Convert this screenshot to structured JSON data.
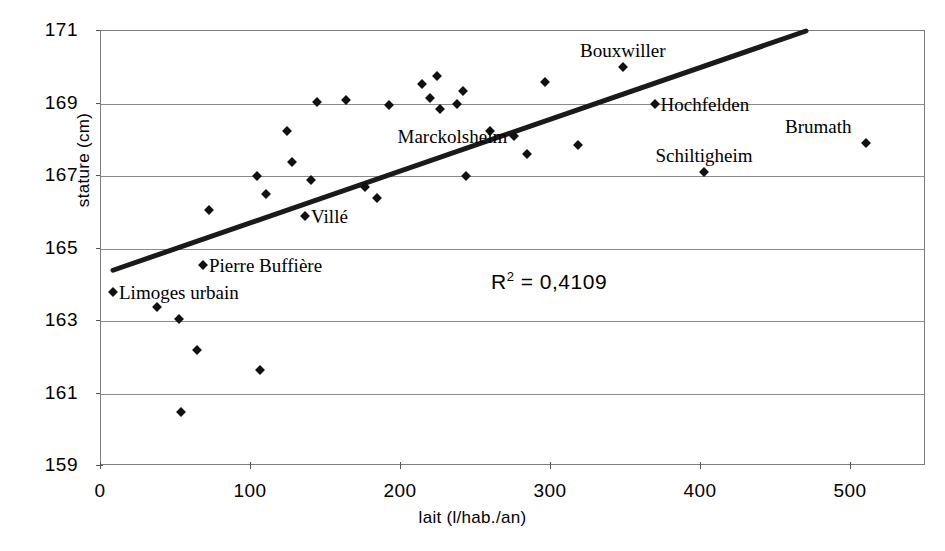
{
  "chart_data": {
    "type": "scatter",
    "title": "",
    "xlabel": "lait  (l/hab./an)",
    "ylabel": "stature  (cm)",
    "xlim": [
      0,
      550
    ],
    "ylim": [
      159,
      171
    ],
    "xticks": [
      0,
      100,
      200,
      300,
      400,
      500
    ],
    "yticks": [
      159,
      161,
      163,
      165,
      167,
      169,
      171
    ],
    "grid": true,
    "legend": null,
    "annotations": [
      {
        "text": "R² = 0,4109",
        "x": 300,
        "y": 164.1,
        "style": "sans-serif"
      }
    ],
    "trendline": {
      "type": "linear",
      "x_start": 8,
      "y_start": 164.4,
      "x_end": 470,
      "y_end": 171.0,
      "r_squared": 0.4109,
      "r_squared_display": "0,4109"
    },
    "points": [
      {
        "x": 8,
        "y": 163.8,
        "label": "Limoges urbain",
        "label_pos": "right"
      },
      {
        "x": 37,
        "y": 163.4,
        "label": null
      },
      {
        "x": 52,
        "y": 163.05,
        "label": null
      },
      {
        "x": 53,
        "y": 160.5,
        "label": null
      },
      {
        "x": 64,
        "y": 162.2,
        "label": null
      },
      {
        "x": 68,
        "y": 164.55,
        "label": "Pierre Buffière",
        "label_pos": "right"
      },
      {
        "x": 72,
        "y": 166.05,
        "label": null
      },
      {
        "x": 104,
        "y": 167.0,
        "label": null
      },
      {
        "x": 106,
        "y": 161.65,
        "label": null
      },
      {
        "x": 110,
        "y": 166.5,
        "label": null
      },
      {
        "x": 124,
        "y": 168.25,
        "label": null
      },
      {
        "x": 127,
        "y": 167.4,
        "label": null
      },
      {
        "x": 136,
        "y": 165.9,
        "label": "Villé",
        "label_pos": "right"
      },
      {
        "x": 140,
        "y": 166.9,
        "label": null
      },
      {
        "x": 144,
        "y": 169.05,
        "label": null
      },
      {
        "x": 163,
        "y": 169.1,
        "label": null
      },
      {
        "x": 176,
        "y": 166.7,
        "label": null
      },
      {
        "x": 184,
        "y": 166.4,
        "label": null
      },
      {
        "x": 192,
        "y": 168.95,
        "label": null
      },
      {
        "x": 214,
        "y": 169.55,
        "label": null
      },
      {
        "x": 219,
        "y": 169.15,
        "label": null
      },
      {
        "x": 224,
        "y": 169.75,
        "label": null
      },
      {
        "x": 226,
        "y": 168.85,
        "label": null
      },
      {
        "x": 237,
        "y": 169.0,
        "label": null
      },
      {
        "x": 241,
        "y": 169.35,
        "label": null
      },
      {
        "x": 243,
        "y": 167.0,
        "label": null
      },
      {
        "x": 259,
        "y": 168.25,
        "label": null
      },
      {
        "x": 275,
        "y": 168.1,
        "label": "Marckolsheim",
        "label_pos": "left"
      },
      {
        "x": 284,
        "y": 167.6,
        "label": null
      },
      {
        "x": 296,
        "y": 169.6,
        "label": null
      },
      {
        "x": 318,
        "y": 167.85,
        "label": null
      },
      {
        "x": 348,
        "y": 170.0,
        "label": "Bouxwiller",
        "label_pos": "above"
      },
      {
        "x": 369,
        "y": 169.0,
        "label": "Hochfelden",
        "label_pos": "right"
      },
      {
        "x": 402,
        "y": 167.1,
        "label": "Schiltigheim",
        "label_pos": "above"
      },
      {
        "x": 510,
        "y": 167.9,
        "label": "Brumath",
        "label_pos": "above-left"
      }
    ]
  },
  "axes": {
    "y_title": "stature  (cm)",
    "x_title": "lait  (l/hab./an)",
    "y_tick_labels": [
      "171",
      "169",
      "167",
      "165",
      "163",
      "161",
      "159"
    ],
    "x_tick_labels": [
      "0",
      "100",
      "200",
      "300",
      "400",
      "500"
    ]
  },
  "r2": {
    "prefix": "R",
    "exponent": "2",
    "equals": " = ",
    "value": "0,4109"
  },
  "labels": {
    "limoges": "Limoges urbain",
    "pierre_buffiere": "Pierre Buffière",
    "ville": "Villé",
    "marckolsheim": "Marckolsheim",
    "bouxwiller": "Bouxwiller",
    "hochfelden": "Hochfelden",
    "schiltigheim": "Schiltigheim",
    "brumath": "Brumath"
  }
}
